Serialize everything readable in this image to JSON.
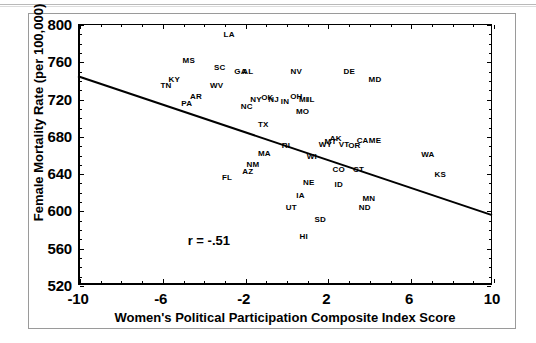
{
  "chart_data": {
    "type": "scatter",
    "title": "",
    "xlabel": "Women's Political Participation Composite Index Score",
    "ylabel": "Female Mortality Rate (per 100,000)",
    "xlim": [
      -10,
      10
    ],
    "ylim": [
      520,
      800
    ],
    "xticks": [
      -10,
      -6,
      -2,
      2,
      6,
      10
    ],
    "xtick_labels": [
      "-10",
      "-6",
      "-2",
      "2",
      "6",
      "10"
    ],
    "yticks": [
      520,
      560,
      600,
      640,
      680,
      720,
      760,
      800
    ],
    "ytick_labels": [
      "520",
      "560",
      "600",
      "640",
      "680",
      "720",
      "760",
      "800"
    ],
    "grid": false,
    "legend": false,
    "annotations": [
      {
        "name": "correlation",
        "text": "r = -.51",
        "x": -4.7,
        "y": 566
      }
    ],
    "trendline": {
      "name": "regression-line",
      "x0": -10,
      "y0": 744,
      "x1": 10,
      "y1": 595
    },
    "point_label_style": "state-abbreviation",
    "points": [
      {
        "label": "LA",
        "x": -2.7,
        "y": 788
      },
      {
        "label": "MS",
        "x": -4.65,
        "y": 760
      },
      {
        "label": "SC",
        "x": -3.15,
        "y": 753
      },
      {
        "label": "GA",
        "x": -2.15,
        "y": 748
      },
      {
        "label": "AL",
        "x": -1.8,
        "y": 748
      },
      {
        "label": "NV",
        "x": 0.55,
        "y": 748
      },
      {
        "label": "DE",
        "x": 3.1,
        "y": 748
      },
      {
        "label": "MD",
        "x": 4.35,
        "y": 740
      },
      {
        "label": "KY",
        "x": -5.35,
        "y": 740
      },
      {
        "label": "TN",
        "x": -5.75,
        "y": 733
      },
      {
        "label": "WV",
        "x": -3.3,
        "y": 733
      },
      {
        "label": "AR",
        "x": -4.3,
        "y": 722
      },
      {
        "label": "NY",
        "x": -1.4,
        "y": 719
      },
      {
        "label": "OK",
        "x": -0.85,
        "y": 721
      },
      {
        "label": "NJ",
        "x": -0.55,
        "y": 719
      },
      {
        "label": "OH",
        "x": 0.55,
        "y": 722
      },
      {
        "label": "MI",
        "x": 0.9,
        "y": 719
      },
      {
        "label": "IL",
        "x": 1.25,
        "y": 718
      },
      {
        "label": "IN",
        "x": 0.0,
        "y": 716
      },
      {
        "label": "PA",
        "x": -4.75,
        "y": 714
      },
      {
        "label": "NC",
        "x": -1.85,
        "y": 711
      },
      {
        "label": "MO",
        "x": 0.85,
        "y": 706
      },
      {
        "label": "TX",
        "x": -1.05,
        "y": 692
      },
      {
        "label": "AK",
        "x": 2.45,
        "y": 677
      },
      {
        "label": "MT",
        "x": 2.2,
        "y": 673
      },
      {
        "label": "WY",
        "x": 1.95,
        "y": 670
      },
      {
        "label": "VT",
        "x": 2.85,
        "y": 670
      },
      {
        "label": "CA",
        "x": 3.75,
        "y": 674
      },
      {
        "label": "ME",
        "x": 4.35,
        "y": 674
      },
      {
        "label": "OR",
        "x": 3.35,
        "y": 669
      },
      {
        "label": "RI",
        "x": 0.05,
        "y": 669
      },
      {
        "label": "MA",
        "x": -1.0,
        "y": 661
      },
      {
        "label": "WI",
        "x": 1.3,
        "y": 657
      },
      {
        "label": "WA",
        "x": 6.9,
        "y": 659
      },
      {
        "label": "NM",
        "x": -1.55,
        "y": 649
      },
      {
        "label": "CO",
        "x": 2.6,
        "y": 643
      },
      {
        "label": "CT",
        "x": 3.55,
        "y": 643
      },
      {
        "label": "AZ",
        "x": -1.8,
        "y": 641
      },
      {
        "label": "KS",
        "x": 7.5,
        "y": 638
      },
      {
        "label": "FL",
        "x": -2.8,
        "y": 635
      },
      {
        "label": "NE",
        "x": 1.15,
        "y": 629
      },
      {
        "label": "ID",
        "x": 2.6,
        "y": 627
      },
      {
        "label": "IA",
        "x": 0.75,
        "y": 615
      },
      {
        "label": "MN",
        "x": 4.05,
        "y": 612
      },
      {
        "label": "ND",
        "x": 3.85,
        "y": 603
      },
      {
        "label": "UT",
        "x": 0.3,
        "y": 603
      },
      {
        "label": "SD",
        "x": 1.7,
        "y": 590
      },
      {
        "label": "HI",
        "x": 0.9,
        "y": 571
      }
    ]
  }
}
